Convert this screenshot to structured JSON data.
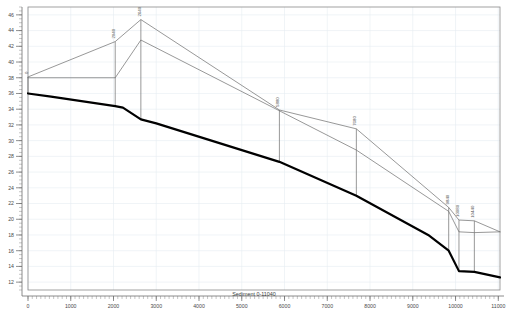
{
  "chart_data": {
    "type": "line",
    "title": "",
    "xlabel": "Sediment 0-11040",
    "ylabel": "",
    "xlim": [
      0,
      11040
    ],
    "ylim": [
      11,
      47
    ],
    "grid": true,
    "legend": false,
    "x_ticks": [
      0,
      1000,
      2000,
      3000,
      4000,
      5000,
      6000,
      7000,
      8000,
      9000,
      10000,
      11000
    ],
    "y_ticks": [
      12,
      14,
      16,
      18,
      20,
      22,
      24,
      26,
      28,
      30,
      32,
      34,
      36,
      38,
      40,
      42,
      44,
      46
    ],
    "x_tick_labels": [
      "0",
      "1000",
      "2000",
      "3000",
      "4000",
      "5000",
      "6000",
      "7000",
      "8000",
      "9000",
      "10000",
      "11000"
    ],
    "y_tick_labels": [
      "12",
      "14",
      "16",
      "18",
      "20",
      "22",
      "24",
      "26",
      "28",
      "30",
      "32",
      "34",
      "36",
      "38",
      "40",
      "42",
      "44",
      "46"
    ],
    "series": [
      {
        "name": "bed-profile",
        "style": "thick-black",
        "color": "#000000",
        "width": 2.2,
        "x": [
          0,
          540,
          2040,
          2220,
          2640,
          3000,
          5880,
          7680,
          9360,
          9840,
          10080,
          10440,
          11040
        ],
        "y": [
          36.0,
          35.6,
          34.4,
          34.2,
          32.7,
          32.2,
          27.3,
          23.0,
          18.0,
          16.0,
          13.4,
          13.3,
          12.6
        ]
      },
      {
        "name": "water-surface-upper",
        "style": "thin-gray",
        "color": "#6b6b6b",
        "width": 0.7,
        "x": [
          0,
          2040,
          2640,
          5880,
          7680,
          9840,
          10080,
          10440,
          11040
        ],
        "y": [
          38.1,
          42.6,
          45.4,
          33.9,
          31.5,
          21.5,
          19.9,
          19.8,
          18.4
        ]
      },
      {
        "name": "energy-grade-lower",
        "style": "thin-gray",
        "color": "#6b6b6b",
        "width": 0.7,
        "x": [
          0,
          2040,
          2640,
          5880,
          7680,
          9840,
          10080,
          10440,
          11040
        ],
        "y": [
          38.0,
          38.0,
          42.8,
          33.8,
          28.8,
          21.0,
          18.4,
          18.3,
          18.4
        ]
      }
    ],
    "stations": [
      {
        "label": "0",
        "x": 0,
        "y_top": 38.1,
        "y_bottom": 36.0
      },
      {
        "label": "2040",
        "x": 2040,
        "y_top": 42.6,
        "y_bottom": 34.4
      },
      {
        "label": "2640",
        "x": 2640,
        "y_top": 45.4,
        "y_bottom": 32.7
      },
      {
        "label": "5880",
        "x": 5880,
        "y_top": 33.9,
        "y_bottom": 27.3
      },
      {
        "label": "7680",
        "x": 7680,
        "y_top": 31.5,
        "y_bottom": 23.0
      },
      {
        "label": "9840",
        "x": 9840,
        "y_top": 21.5,
        "y_bottom": 16.0
      },
      {
        "label": "10080",
        "x": 10080,
        "y_top": 19.9,
        "y_bottom": 13.4
      },
      {
        "label": "10440",
        "x": 10440,
        "y_top": 19.8,
        "y_bottom": 13.3
      }
    ],
    "annotations": []
  },
  "axes": {
    "x_title": "Sediment 0-11040"
  }
}
